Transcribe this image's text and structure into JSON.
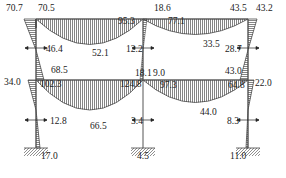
{
  "diagram": {
    "type": "bending-moment-diagram",
    "frame": {
      "storeys": 2,
      "bays": 2
    },
    "labels": [
      {
        "id": "m1",
        "text": "70.7",
        "x": 6,
        "y": 4
      },
      {
        "id": "m2",
        "text": "70.5",
        "x": 38,
        "y": 4
      },
      {
        "id": "m3",
        "text": "95.3",
        "x": 118,
        "y": 17
      },
      {
        "id": "m4",
        "text": "18.6",
        "x": 154,
        "y": 4
      },
      {
        "id": "m5",
        "text": "77.1",
        "x": 168,
        "y": 17
      },
      {
        "id": "m6",
        "text": "43.5",
        "x": 230,
        "y": 4
      },
      {
        "id": "m7",
        "text": "43.2",
        "x": 256,
        "y": 4
      },
      {
        "id": "m8",
        "text": "46.4",
        "x": 46,
        "y": 45
      },
      {
        "id": "m9",
        "text": "52.1",
        "x": 92,
        "y": 49
      },
      {
        "id": "m10",
        "text": "12.2",
        "x": 126,
        "y": 45
      },
      {
        "id": "m11",
        "text": "33.5",
        "x": 203,
        "y": 40
      },
      {
        "id": "m12",
        "text": "28.7",
        "x": 225,
        "y": 45
      },
      {
        "id": "m13",
        "text": "68.5",
        "x": 51,
        "y": 66
      },
      {
        "id": "m14",
        "text": "18.1",
        "x": 135,
        "y": 69
      },
      {
        "id": "m15",
        "text": "9.0",
        "x": 153,
        "y": 69
      },
      {
        "id": "m16",
        "text": "43.0",
        "x": 225,
        "y": 67
      },
      {
        "id": "m17",
        "text": "34.0",
        "x": 4,
        "y": 78
      },
      {
        "id": "m18",
        "text": "102.3",
        "x": 40,
        "y": 80
      },
      {
        "id": "m19",
        "text": "124.8",
        "x": 120,
        "y": 80
      },
      {
        "id": "m20",
        "text": "97.3",
        "x": 160,
        "y": 81
      },
      {
        "id": "m21",
        "text": "64.8",
        "x": 228,
        "y": 81
      },
      {
        "id": "m22",
        "text": "22.0",
        "x": 255,
        "y": 79
      },
      {
        "id": "m23",
        "text": "44.0",
        "x": 200,
        "y": 108
      },
      {
        "id": "m24",
        "text": "12.8",
        "x": 50,
        "y": 117
      },
      {
        "id": "m25",
        "text": "66.5",
        "x": 90,
        "y": 122
      },
      {
        "id": "m26",
        "text": "3.4",
        "x": 131,
        "y": 117
      },
      {
        "id": "m27",
        "text": "8.3",
        "x": 227,
        "y": 117
      },
      {
        "id": "m28",
        "text": "17.0",
        "x": 41,
        "y": 152
      },
      {
        "id": "m29",
        "text": "4.5",
        "x": 137,
        "y": 152
      },
      {
        "id": "m30",
        "text": "11.0",
        "x": 230,
        "y": 152
      }
    ]
  }
}
